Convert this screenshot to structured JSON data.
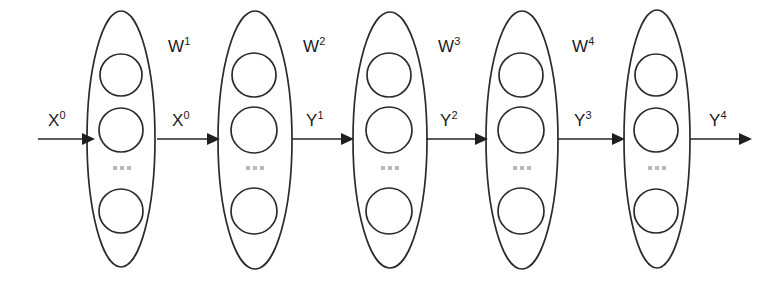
{
  "figure": {
    "kind": "neural-network-layer-diagram",
    "background_color": "#ffffff",
    "stroke_color": "#2b2b2b",
    "text_color": "#1c1c1c",
    "dots_color": "#b9b9b9",
    "width": 770,
    "height": 281
  },
  "layers": [
    {
      "id": "layer-0",
      "name": "input-layer",
      "nodes_shown": 3,
      "ellipsis": "...",
      "cx": 121,
      "cy": 139,
      "rx": 34,
      "ry": 128
    },
    {
      "id": "layer-1",
      "name": "hidden-layer-1",
      "nodes_shown": 3,
      "ellipsis": "...",
      "cx": 255,
      "cy": 140,
      "rx": 37,
      "ry": 129
    },
    {
      "id": "layer-2",
      "name": "hidden-layer-2",
      "nodes_shown": 3,
      "ellipsis": "...",
      "cx": 390,
      "cy": 140,
      "rx": 37,
      "ry": 128
    },
    {
      "id": "layer-3",
      "name": "hidden-layer-3",
      "nodes_shown": 3,
      "ellipsis": "...",
      "cx": 522,
      "cy": 140,
      "rx": 36,
      "ry": 129
    },
    {
      "id": "layer-4",
      "name": "output-layer",
      "nodes_shown": 3,
      "ellipsis": "...",
      "cx": 657,
      "cy": 139,
      "rx": 33,
      "ry": 129
    }
  ],
  "node_label": "",
  "signals": [
    {
      "id": "signal-in",
      "base": "X",
      "exponent": "0",
      "label": "X0",
      "x": 48,
      "y": 112
    },
    {
      "id": "signal-x0",
      "base": "X",
      "exponent": "0",
      "label": "X0",
      "x": 172,
      "y": 112
    },
    {
      "id": "signal-y1",
      "base": "Y",
      "exponent": "1",
      "label": "Y1",
      "x": 306,
      "y": 112
    },
    {
      "id": "signal-y2",
      "base": "Y",
      "exponent": "2",
      "label": "Y2",
      "x": 440,
      "y": 112
    },
    {
      "id": "signal-y3",
      "base": "Y",
      "exponent": "3",
      "label": "Y3",
      "x": 574,
      "y": 112
    },
    {
      "id": "signal-y4",
      "base": "Y",
      "exponent": "4",
      "label": "Y4",
      "x": 709,
      "y": 112
    }
  ],
  "weights": [
    {
      "id": "weight-1",
      "base": "W",
      "exponent": "1",
      "label": "W1",
      "x": 168,
      "y": 38
    },
    {
      "id": "weight-2",
      "base": "W",
      "exponent": "2",
      "label": "W2",
      "x": 303,
      "y": 38
    },
    {
      "id": "weight-3",
      "base": "W",
      "exponent": "3",
      "label": "W3",
      "x": 438,
      "y": 38
    },
    {
      "id": "weight-4",
      "base": "W",
      "exponent": "4",
      "label": "W4",
      "x": 572,
      "y": 38
    }
  ],
  "arrows": [
    {
      "id": "arrow-input",
      "name": "arrow-input-to-layer-0",
      "x1": 38,
      "x2": 88,
      "y": 139
    },
    {
      "id": "arrow-0-1",
      "name": "arrow-layer-0-to-layer-1",
      "x1": 157,
      "x2": 220,
      "y": 139
    },
    {
      "id": "arrow-1-2",
      "name": "arrow-layer-1-to-layer-2",
      "x1": 292,
      "x2": 354,
      "y": 139
    },
    {
      "id": "arrow-2-3",
      "name": "arrow-layer-2-to-layer-3",
      "x1": 426,
      "x2": 488,
      "y": 139
    },
    {
      "id": "arrow-3-4",
      "name": "arrow-layer-3-to-layer-4",
      "x1": 557,
      "x2": 625,
      "y": 139
    },
    {
      "id": "arrow-output",
      "name": "arrow-layer-4-to-output",
      "x1": 690,
      "x2": 752,
      "y": 139
    }
  ]
}
